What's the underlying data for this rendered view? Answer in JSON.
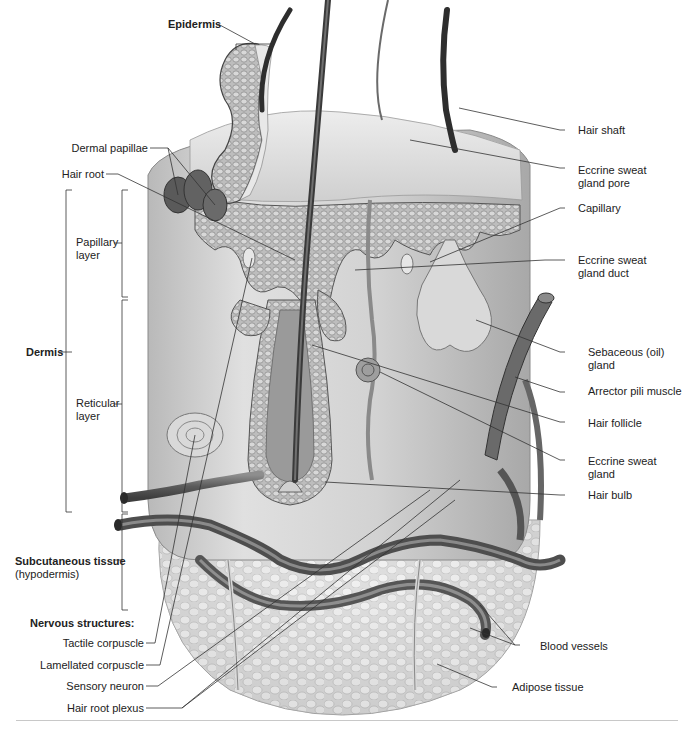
{
  "figure": {
    "colors": {
      "tissue_light": "#e4e4e4",
      "tissue_mid": "#bdbdbd",
      "tissue_dark": "#5a5a5a",
      "vessel": "#6e6e6e",
      "leader": "#333333",
      "rule": "#c8c8c8"
    }
  },
  "labels_left": {
    "epidermis": "Epidermis",
    "dermal_papillae": "Dermal papillae",
    "hair_root": "Hair root",
    "papillary_layer_1": "Papillary",
    "papillary_layer_2": "layer",
    "dermis": "Dermis",
    "reticular_layer_1": "Reticular",
    "reticular_layer_2": "layer",
    "subcutaneous_1": "Subcutaneous tissue",
    "subcutaneous_2": "(hypodermis)",
    "nervous_heading": "Nervous structures:",
    "tactile_corpuscle": "Tactile corpuscle",
    "lamellated_corpuscle": "Lamellated corpuscle",
    "sensory_neuron": "Sensory neuron",
    "hair_root_plexus": "Hair root plexus"
  },
  "labels_right": {
    "hair_shaft": "Hair shaft",
    "eccrine_pore_1": "Eccrine sweat",
    "eccrine_pore_2": "gland pore",
    "capillary": "Capillary",
    "eccrine_duct_1": "Eccrine sweat",
    "eccrine_duct_2": "gland duct",
    "sebaceous_1": "Sebaceous (oil)",
    "sebaceous_2": "gland",
    "arrector_pili": "Arrector pili muscle",
    "hair_follicle": "Hair follicle",
    "eccrine_gland_1": "Eccrine sweat",
    "eccrine_gland_2": "gland",
    "hair_bulb": "Hair bulb",
    "blood_vessels": "Blood vessels",
    "adipose_tissue": "Adipose tissue"
  }
}
